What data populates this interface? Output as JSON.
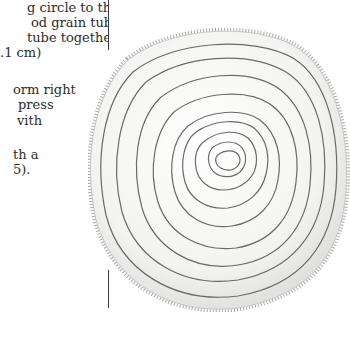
{
  "text_column": {
    "lines": [
      {
        "text": "g circle to the",
        "left": 27,
        "top": 0
      },
      {
        "text": "od grain tube.",
        "left": 31,
        "top": 15
      },
      {
        "text": " tube together.",
        "left": 27,
        "top": 30
      },
      {
        "text": ".1 cm)",
        "left": 0,
        "top": 45
      },
      {
        "text": "orm right",
        "left": 13,
        "top": 82
      },
      {
        "text": "press",
        "left": 18,
        "top": 97
      },
      {
        "text": "vith",
        "left": 17,
        "top": 113
      },
      {
        "text": "th a",
        "left": 13,
        "top": 147
      },
      {
        "text": "5).",
        "left": 13,
        "top": 162
      }
    ]
  },
  "rules": [
    {
      "top": 0,
      "height": 50
    },
    {
      "top": 270,
      "height": 38
    }
  ],
  "figure": {
    "stroke_color": "#6a6a6a",
    "fabric_color": "#f4f4f2",
    "fringe_color": "#9a9a9a"
  }
}
